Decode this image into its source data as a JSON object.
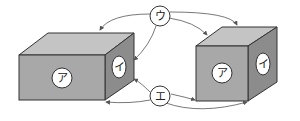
{
  "diagram": {
    "colors": {
      "front": "#a8a8a8",
      "top": "#c4c4c4",
      "side": "#8c8c8c",
      "stroke": "#333333",
      "arrow": "#555555",
      "label_bg": "#ffffff"
    },
    "left_box": {
      "front_label": "ア",
      "side_label": "イ"
    },
    "right_cube": {
      "front_label": "ア",
      "side_label": "イ"
    },
    "connectors": {
      "top_label": "ウ",
      "bottom_label": "エ"
    }
  }
}
